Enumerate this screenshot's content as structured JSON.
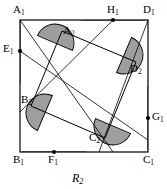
{
  "figure": {
    "caption": "R",
    "caption_sub": "2",
    "fill_color": "#9e9e9e",
    "stroke_color": "#000000",
    "background_color": "#ffffff"
  },
  "outer_square": {
    "name": "A1B1C1D1",
    "left": 20,
    "top": 20,
    "right": 148,
    "bottom": 152,
    "vertices": [
      {
        "id": "A1",
        "letter": "A",
        "sub": "1",
        "x": 20,
        "y": 20,
        "label_x": 13,
        "label_y": 4,
        "dot": false
      },
      {
        "id": "D1",
        "letter": "D",
        "sub": "1",
        "x": 148,
        "y": 20,
        "label_x": 143,
        "label_y": 4,
        "dot": false
      },
      {
        "id": "C1",
        "letter": "C",
        "sub": "1",
        "x": 148,
        "y": 152,
        "label_x": 143,
        "label_y": 154,
        "dot": false
      },
      {
        "id": "B1",
        "letter": "B",
        "sub": "1",
        "x": 20,
        "y": 152,
        "label_x": 13,
        "label_y": 154,
        "dot": false
      }
    ]
  },
  "midpoints": [
    {
      "id": "E1",
      "letter": "E",
      "sub": "1",
      "x": 20,
      "y": 51,
      "label_x": 3,
      "label_y": 43,
      "dot": true
    },
    {
      "id": "F1",
      "letter": "F",
      "sub": "1",
      "x": 54,
      "y": 152,
      "label_x": 48,
      "label_y": 154,
      "dot": true
    },
    {
      "id": "G1",
      "letter": "G",
      "sub": "1",
      "x": 148,
      "y": 118,
      "label_x": 152,
      "label_y": 111,
      "dot": true
    },
    {
      "id": "H1",
      "letter": "H",
      "sub": "1",
      "x": 113,
      "y": 20,
      "label_x": 107,
      "label_y": 4,
      "dot": true
    }
  ],
  "inner_square": {
    "name": "A2B2C2D2",
    "vertices": [
      {
        "id": "A2",
        "letter": "A",
        "sub": "2",
        "x": 62,
        "y": 31,
        "label_x": 63,
        "label_y": 25,
        "dot": false
      },
      {
        "id": "D2",
        "letter": "D",
        "sub": "2",
        "x": 136,
        "y": 62,
        "label_x": 130,
        "label_y": 63,
        "dot": false
      },
      {
        "id": "C2",
        "letter": "C",
        "sub": "2",
        "x": 105,
        "y": 138,
        "label_x": 89,
        "label_y": 132,
        "dot": false
      },
      {
        "id": "B2",
        "letter": "B",
        "sub": "2",
        "x": 31,
        "y": 106,
        "label_x": 21,
        "label_y": 94,
        "dot": false
      }
    ]
  },
  "construction_lines": [
    {
      "name": "line-A1-C2",
      "x1": 20,
      "y1": 20,
      "x2": 113,
      "y2": 152
    },
    {
      "name": "line-H1-B2",
      "x1": 113,
      "y1": 20,
      "x2": 20,
      "y2": 112
    },
    {
      "name": "line-D1-F1",
      "x1": 148,
      "y1": 20,
      "x2": 99,
      "y2": 152
    },
    {
      "name": "line-E1-C1",
      "x1": 20,
      "y1": 51,
      "x2": 148,
      "y2": 140
    }
  ],
  "half_disks": {
    "large": [
      {
        "name": "half-disk-E1",
        "cx": 20,
        "cy": 51,
        "r": 32,
        "rotate": -90
      },
      {
        "name": "half-disk-H1",
        "cx": 113,
        "cy": 20,
        "r": 32,
        "rotate": 0
      },
      {
        "name": "half-disk-G1",
        "cx": 148,
        "cy": 118,
        "r": 32,
        "rotate": 90
      },
      {
        "name": "half-disk-F1",
        "cx": 54,
        "cy": 152,
        "r": 32,
        "rotate": 180
      }
    ],
    "small": [
      {
        "name": "half-disk-A2",
        "cx": 55,
        "cy": 43,
        "r": 19,
        "rotate": 23
      },
      {
        "name": "half-disk-D2",
        "cx": 124,
        "cy": 55,
        "r": 19,
        "rotate": 113
      },
      {
        "name": "half-disk-C2",
        "cx": 113,
        "cy": 126,
        "r": 19,
        "rotate": 203
      },
      {
        "name": "half-disk-B2",
        "cx": 45,
        "cy": 113,
        "r": 19,
        "rotate": 293
      }
    ]
  }
}
